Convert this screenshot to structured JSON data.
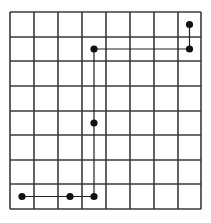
{
  "grid": {
    "cols": 8,
    "rows": 8,
    "x_lines": [
      10,
      34,
      58,
      82,
      106,
      130,
      154,
      178,
      201
    ],
    "y_lines": [
      12,
      37,
      61,
      86,
      111,
      135,
      160,
      184,
      209
    ],
    "line_color": "#3a3a3a",
    "line_width": 1.6
  },
  "path": {
    "color": "#222222",
    "width": 1.2,
    "points": [
      {
        "col": 7,
        "row": 0
      },
      {
        "col": 7,
        "row": 1
      },
      {
        "col": 3,
        "row": 1
      },
      {
        "col": 3,
        "row": 4
      },
      {
        "col": 3,
        "row": 7
      },
      {
        "col": 2,
        "row": 7
      },
      {
        "col": 0,
        "row": 7
      }
    ],
    "dot_color": "#111111",
    "dot_radius": 3.6
  }
}
